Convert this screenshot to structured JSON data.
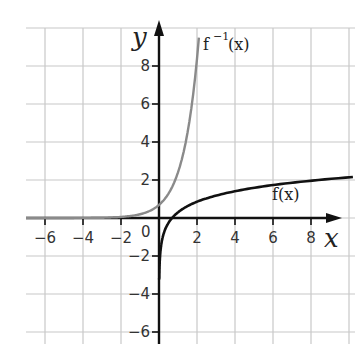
{
  "chart_data": {
    "type": "line",
    "title": "",
    "xlabel": "x",
    "ylabel": "y",
    "xlim": [
      -7,
      10.5
    ],
    "ylim": [
      -7,
      10.5
    ],
    "grid": true,
    "grid_step": 2,
    "origin_label": "0",
    "x_ticks": [
      -6,
      -4,
      -2,
      2,
      4,
      6,
      8
    ],
    "x_tick_labels": [
      "−6",
      "−4",
      "−2",
      "2",
      "4",
      "6",
      "8"
    ],
    "y_ticks": [
      8,
      6,
      4,
      2,
      -2,
      -4,
      -6
    ],
    "y_tick_labels": [
      "8",
      "6",
      "4",
      "2",
      "−2",
      "−4",
      "−6"
    ],
    "series": [
      {
        "name": "f(x)",
        "label": "f(x)",
        "color": "#111111",
        "description": "logarithmic curve, vertical asymptote x=0, crosses x-axis near x≈0.7",
        "x": [
          0.05,
          0.2,
          0.5,
          0.7,
          1,
          2,
          4,
          6,
          8,
          10
        ],
        "values": [
          -2.1,
          -1.0,
          -0.25,
          0.0,
          0.3,
          0.85,
          1.4,
          1.7,
          1.95,
          2.15
        ]
      },
      {
        "name": "f^-1(x)",
        "label": "f⁻¹(x)",
        "color": "#888888",
        "description": "exponential curve, horizontal asymptote y=0, passes y≈0.7 at x=0",
        "x": [
          -7,
          -6,
          -4,
          -2,
          0,
          0.85,
          1.4,
          1.7,
          1.95,
          2.15
        ],
        "values": [
          0.01,
          0.02,
          0.05,
          0.15,
          0.7,
          2,
          4,
          6,
          8,
          10
        ]
      }
    ]
  },
  "labels": {
    "x_axis": "x",
    "y_axis": "y",
    "origin": "0",
    "f": "f(x)",
    "f_inverse_base": "f",
    "f_inverse_sup": "−1",
    "f_inverse_arg": "(x)"
  }
}
